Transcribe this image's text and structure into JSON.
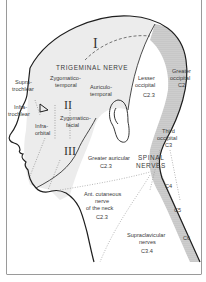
{
  "diagram": {
    "colors": {
      "trigeminal_fill": "#ececec",
      "cervical_dorsal_fill": "#cfcfcf",
      "outline": "#1e1e1e",
      "frame": "#9a9a9a",
      "text": "#3a3a3a"
    },
    "trigeminal": {
      "heading": "TRIGEMINAL NERVE",
      "divisions": {
        "ophthalmic": "I",
        "maxillary": "II",
        "mandibular": "III"
      }
    },
    "labels": {
      "supratrochlear": [
        "Supra-",
        "trochlear"
      ],
      "infratrochlear": [
        "Infra-",
        "trochlear"
      ],
      "infraorbital": [
        "Infra-",
        "orbital"
      ],
      "zygomaticotemporal": [
        "Zygomatico-",
        "temporal"
      ],
      "zygomaticofacial": [
        "Zygomatico-",
        "facial"
      ],
      "auriculotemporal": [
        "Auriculo-",
        "temporal"
      ],
      "lesser_occipital": {
        "lines": [
          "Lesser",
          "occipital"
        ],
        "root": "C2.3"
      },
      "greater_occipital": {
        "lines": [
          "Greater",
          "occipital"
        ],
        "root": "C2"
      },
      "third_occipital": {
        "lines": [
          "Third",
          "occipital"
        ],
        "root": "C3"
      },
      "greater_auricular": {
        "lines": [
          "Greater auricular"
        ],
        "root": "C2.3"
      },
      "spinal_nerves": [
        "SPINAL",
        "NERVES"
      ],
      "ant_cutaneous": {
        "lines": [
          "Ant. cutaneous",
          "nerve",
          "of the neck"
        ],
        "root": "C2.3"
      },
      "supraclavicular": {
        "lines": [
          "Supraclavicular",
          "nerves"
        ],
        "root": "C3.4"
      }
    },
    "dorsal_rami": [
      "C4",
      "C5",
      "C6"
    ]
  }
}
